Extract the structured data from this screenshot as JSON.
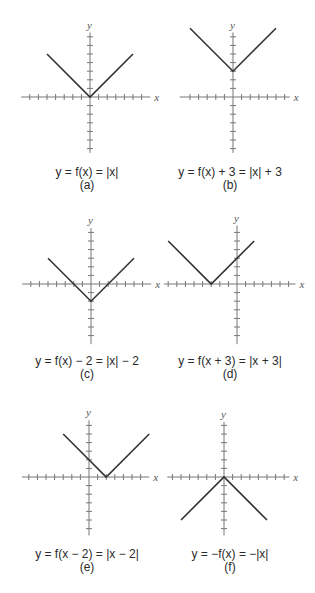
{
  "figure": {
    "unit_px": 8.6,
    "colors": {
      "axis": "#777777",
      "graph": "#333333",
      "text": "#2a2a2a",
      "background": "#ffffff"
    },
    "axis_labels": {
      "x": "x",
      "y": "y"
    },
    "panels": [
      {
        "id": "a",
        "equation": "y = f(x) = |x|",
        "label": "(a)",
        "origin": [
          90,
          97
        ],
        "x_range": [
          -8,
          7
        ],
        "y_range": [
          -6.5,
          7.5
        ],
        "vertex": [
          0,
          0
        ],
        "arm_points": [
          [
            -5,
            5
          ],
          [
            0,
            0
          ],
          [
            5,
            5
          ]
        ],
        "caption_center": [
          87,
          173
        ]
      },
      {
        "id": "b",
        "equation": "y = f(x) + 3 = |x| + 3",
        "label": "(b)",
        "origin": [
          233,
          97
        ],
        "x_range": [
          -6.2,
          6.6
        ],
        "y_range": [
          -6.5,
          7.5
        ],
        "vertex": [
          0,
          3
        ],
        "arm_points": [
          [
            -5,
            8
          ],
          [
            0,
            3
          ],
          [
            5,
            8
          ]
        ],
        "caption_center": [
          230,
          173
        ]
      },
      {
        "id": "c",
        "equation": "y = f(x) − 2 = |x| − 2",
        "label": "(c)",
        "origin": [
          91,
          284
        ],
        "x_range": [
          -8,
          7
        ],
        "y_range": [
          -7,
          6.5
        ],
        "vertex": [
          0,
          -2
        ],
        "arm_points": [
          [
            -5,
            3
          ],
          [
            0,
            -2
          ],
          [
            5,
            3
          ]
        ],
        "caption_center": [
          87,
          362
        ]
      },
      {
        "id": "d",
        "equation": "y = f(x + 3) = |x + 3|",
        "label": "(d)",
        "origin": [
          237,
          284
        ],
        "x_range": [
          -8.5,
          6.8
        ],
        "y_range": [
          -7,
          6.8
        ],
        "vertex": [
          -3,
          0
        ],
        "arm_points": [
          [
            -8,
            5
          ],
          [
            -3,
            0
          ],
          [
            2,
            5
          ]
        ],
        "caption_center": [
          230,
          362
        ]
      },
      {
        "id": "e",
        "equation": "y = f(x − 2) = |x − 2|",
        "label": "(e)",
        "origin": [
          89,
          477
        ],
        "x_range": [
          -7.8,
          7
        ],
        "y_range": [
          -6.8,
          6.6
        ],
        "vertex": [
          2,
          0
        ],
        "arm_points": [
          [
            -3,
            5
          ],
          [
            2,
            0
          ],
          [
            7,
            5
          ]
        ],
        "caption_center": [
          87,
          555
        ]
      },
      {
        "id": "f",
        "equation": "y = −f(x) = −|x|",
        "label": "(f)",
        "origin": [
          224,
          477
        ],
        "x_range": [
          -6.6,
          7.6
        ],
        "y_range": [
          -6.8,
          6.4
        ],
        "vertex": [
          0,
          0
        ],
        "arm_points": [
          [
            -5,
            -5
          ],
          [
            0,
            0
          ],
          [
            5,
            -5
          ]
        ],
        "caption_center": [
          230,
          555
        ]
      }
    ]
  }
}
